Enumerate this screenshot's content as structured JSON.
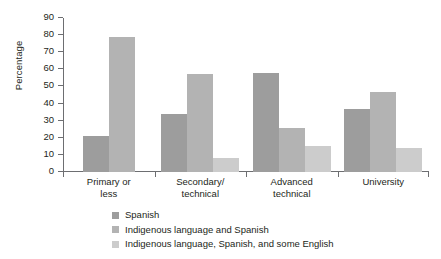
{
  "chart_data": {
    "type": "bar",
    "title": "",
    "subtitle": "",
    "xlabel": "",
    "ylabel": "Percentage",
    "ylim": [
      0,
      90
    ],
    "ytick_step": 10,
    "yticks": [
      0,
      10,
      20,
      30,
      40,
      50,
      60,
      70,
      80,
      90
    ],
    "ytick_labels": [
      "0",
      "10",
      "20",
      "30",
      "40",
      "50",
      "60",
      "70",
      "80",
      "90"
    ],
    "grid": false,
    "legend_position": "bottom-left",
    "categories": [
      "Primary or less",
      "Secondary/ technical",
      "Advanced technical",
      "University"
    ],
    "category_lines": [
      [
        "Primary or",
        "less"
      ],
      [
        "Secondary/",
        "technical"
      ],
      [
        "Advanced",
        "technical"
      ],
      [
        "University",
        ""
      ]
    ],
    "series": [
      {
        "name": "Spanish",
        "color": "#9d9d9d",
        "values": [
          21,
          34,
          58,
          37
        ]
      },
      {
        "name": "Indigenous language and Spanish",
        "color": "#b3b3b3",
        "values": [
          79,
          57,
          26,
          47
        ]
      },
      {
        "name": "Indigenous language, Spanish, and some English",
        "color": "#cccccc",
        "values": [
          null,
          8,
          15,
          14
        ]
      }
    ]
  },
  "axis": {
    "line_color": "#6d6e71"
  }
}
